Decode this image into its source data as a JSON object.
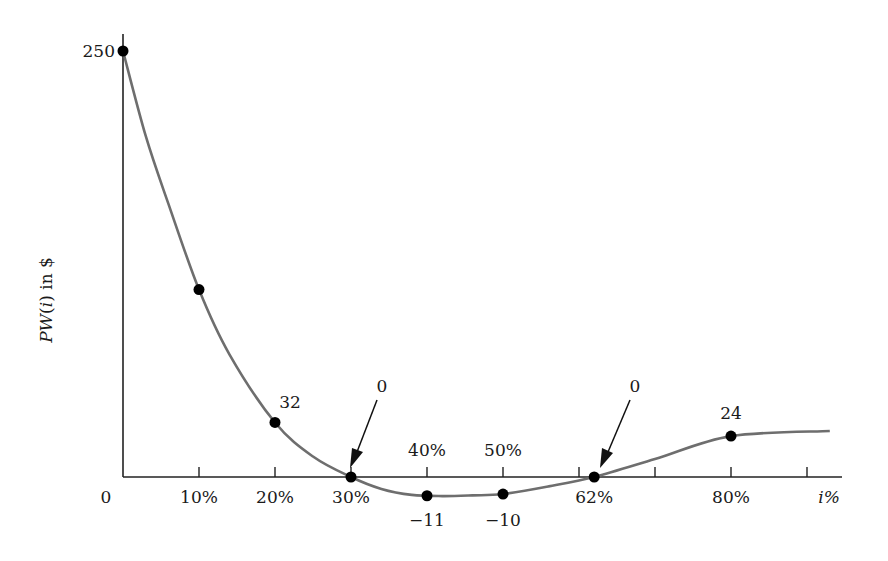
{
  "chart_data": {
    "type": "line",
    "title": "",
    "xlabel": "i%",
    "ylabel": "PW(i) in $",
    "x_ticks": [
      0,
      10,
      20,
      30,
      40,
      50,
      60,
      70,
      80,
      90
    ],
    "x_tick_labels": [
      {
        "x": 0,
        "label": "0",
        "position": "below"
      },
      {
        "x": 10,
        "label": "10%",
        "position": "below"
      },
      {
        "x": 20,
        "label": "20%",
        "position": "below"
      },
      {
        "x": 30,
        "label": "30%",
        "position": "below"
      },
      {
        "x": 40,
        "label": "40%",
        "position": "above"
      },
      {
        "x": 50,
        "label": "50%",
        "position": "above"
      },
      {
        "x": 62,
        "label": "62%",
        "position": "below"
      },
      {
        "x": 80,
        "label": "80%",
        "position": "below"
      }
    ],
    "y_tick_labels": [
      {
        "y": 250,
        "label": "250"
      }
    ],
    "xlim": [
      0,
      95
    ],
    "ylim": [
      -15,
      250
    ],
    "grid": false,
    "series": [
      {
        "name": "PW(i)",
        "color": "#6e6e6e",
        "points": [
          {
            "x": 0,
            "y": 250,
            "label": "250"
          },
          {
            "x": 10,
            "y": 110,
            "label": ""
          },
          {
            "x": 20,
            "y": 32,
            "label": "32"
          },
          {
            "x": 30,
            "y": 0,
            "label": "0"
          },
          {
            "x": 40,
            "y": -11,
            "label": "-11"
          },
          {
            "x": 50,
            "y": -10,
            "label": "-10"
          },
          {
            "x": 62,
            "y": 0,
            "label": "0"
          },
          {
            "x": 80,
            "y": 24,
            "label": "24"
          }
        ],
        "curve": [
          [
            0,
            250
          ],
          [
            3,
            200
          ],
          [
            6,
            160
          ],
          [
            10,
            110
          ],
          [
            14,
            72
          ],
          [
            20,
            32
          ],
          [
            25,
            12
          ],
          [
            30,
            0
          ],
          [
            34,
            -7
          ],
          [
            38,
            -10.5
          ],
          [
            42,
            -11.2
          ],
          [
            46,
            -10.8
          ],
          [
            50,
            -10
          ],
          [
            56,
            -5.5
          ],
          [
            62,
            0
          ],
          [
            70,
            10.5
          ],
          [
            80,
            24
          ],
          [
            93,
            27
          ]
        ]
      }
    ],
    "annotations": [
      {
        "text": "0",
        "target_x": 30,
        "arrow": true
      },
      {
        "text": "0",
        "target_x": 62,
        "arrow": true
      }
    ]
  }
}
